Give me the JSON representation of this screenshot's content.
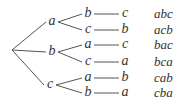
{
  "diagram": {
    "type": "tree",
    "root": {
      "x": 12,
      "y": 50
    },
    "level1": [
      {
        "label": "a",
        "x": 52,
        "y": 22
      },
      {
        "label": "b",
        "x": 52,
        "y": 52
      },
      {
        "label": "c",
        "x": 50,
        "y": 85
      }
    ],
    "level2": [
      {
        "label": "b",
        "parent": 0,
        "x": 88,
        "y": 14
      },
      {
        "label": "c",
        "parent": 0,
        "x": 88,
        "y": 30
      },
      {
        "label": "a",
        "parent": 1,
        "x": 88,
        "y": 45
      },
      {
        "label": "c",
        "parent": 1,
        "x": 88,
        "y": 62
      },
      {
        "label": "a",
        "parent": 2,
        "x": 88,
        "y": 78
      },
      {
        "label": "b",
        "parent": 2,
        "x": 88,
        "y": 93
      }
    ],
    "level3": [
      {
        "label": "c",
        "x": 125,
        "y": 14
      },
      {
        "label": "b",
        "x": 125,
        "y": 30
      },
      {
        "label": "c",
        "x": 125,
        "y": 45
      },
      {
        "label": "a",
        "x": 125,
        "y": 62
      },
      {
        "label": "b",
        "x": 125,
        "y": 78
      },
      {
        "label": "a",
        "x": 125,
        "y": 93
      }
    ],
    "results": [
      "abc",
      "acb",
      "bac",
      "bca",
      "cab",
      "cba"
    ],
    "results_x": 154,
    "line_color": "#555555",
    "text_color": "#333333"
  }
}
